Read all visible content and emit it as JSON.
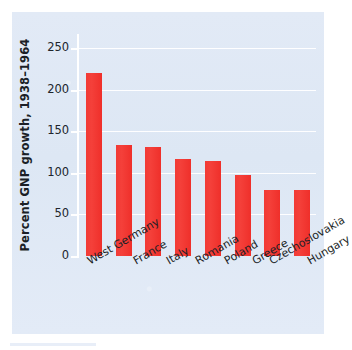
{
  "figure": {
    "background_color": "#ffffff",
    "panel_color": "#dfe8f5",
    "bar_color": "#f4342f",
    "gridline_color": "#ffffff",
    "text_color": "#1b1f26"
  },
  "chart_data": {
    "type": "bar",
    "title": "",
    "xlabel": "",
    "ylabel": "Percent GNP growth, 1938–1964",
    "categories": [
      "West Germany",
      "France",
      "Italy",
      "Romania",
      "Poland",
      "Greece",
      "Czechoslovakia",
      "Hungary"
    ],
    "values": [
      220,
      134,
      131,
      117,
      114,
      97,
      79,
      79
    ],
    "ylim": [
      0,
      262
    ],
    "yticks": [
      0,
      50,
      100,
      150,
      200,
      250
    ],
    "ytick_labels": [
      "0",
      "50",
      "100",
      "150",
      "200",
      "250"
    ],
    "grid": true,
    "grid_axis": "y",
    "legend": null,
    "legend_position": "none",
    "orientation": "vertical",
    "xtick_rotation": -30
  }
}
